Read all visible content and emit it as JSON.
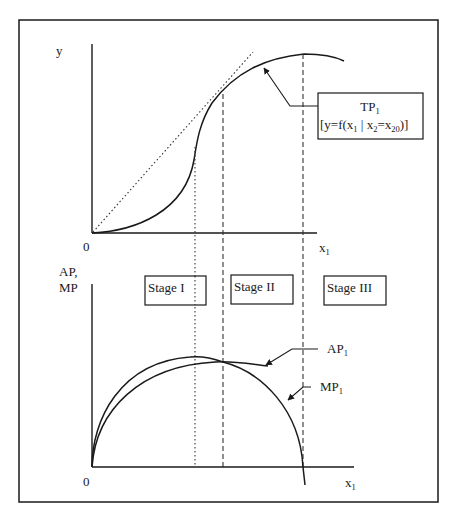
{
  "diagram": {
    "type": "production-function-stages",
    "frame_color": "#1a1a1a",
    "top_panel": {
      "y_axis_label": "y",
      "origin_label": "0",
      "x_axis_label": "x",
      "x_axis_sub": "1",
      "curve_label": {
        "line1_main": "TP",
        "line1_sub": "1",
        "line2_prefix": "[y=f(x",
        "line2_sub1": "1",
        "line2_mid": " | x",
        "line2_sub2": "2",
        "line2_eq": "=x",
        "line2_sub3": "20",
        "line2_suffix": ")]"
      }
    },
    "bottom_panel": {
      "y_axis_label_line1": "AP,",
      "y_axis_label_line2": "MP",
      "origin_label": "0",
      "x_axis_label": "x",
      "x_axis_sub": "1",
      "stages": [
        {
          "label": "Stage I"
        },
        {
          "label": "Stage II"
        },
        {
          "label": "Stage III"
        }
      ],
      "ap_label": "AP",
      "ap_sub": "1",
      "mp_label": "MP",
      "mp_sub": "1"
    }
  }
}
